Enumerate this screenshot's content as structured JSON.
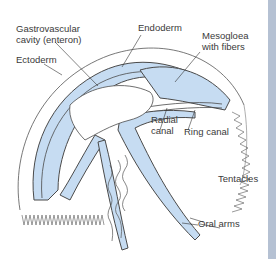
{
  "diagram": {
    "labels": {
      "gastrovascular_1": "Gastrovascular",
      "gastrovascular_2": "cavity (enteron)",
      "ectoderm": "Ectoderm",
      "endoderm": "Endoderm",
      "mesogloea_1": "Mesogloea",
      "mesogloea_2": "with fibers",
      "radial_1": "Radial",
      "radial_2": "canal",
      "ring_canal": "Ring canal",
      "tentacles": "Tentacles",
      "oral_arms": "Oral arms"
    },
    "colors": {
      "tissue_fill": "#c6dcf2",
      "outline": "#4a4a4a",
      "side_bar": "#b5c1d3",
      "background": "#ffffff"
    }
  }
}
